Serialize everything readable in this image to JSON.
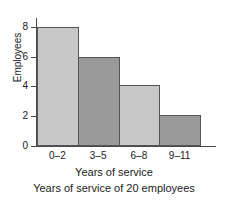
{
  "chart_data": {
    "type": "bar",
    "title": "",
    "categories": [
      "0–2",
      "3–5",
      "6–8",
      "9–11"
    ],
    "values": [
      8,
      6,
      4.1,
      2.1
    ],
    "value_labels": [
      "8",
      "6",
      "4",
      "2"
    ],
    "xlabel": "Years of service",
    "ylabel": "Employees",
    "ylim": [
      0,
      8.6
    ],
    "xlim": [
      0,
      4
    ],
    "yticks": [
      0,
      2,
      4,
      6,
      8
    ],
    "ytick_labels": [
      "0",
      "2",
      "4",
      "6",
      "8"
    ],
    "grid": false,
    "legend": false,
    "caption": "Years of service of 20 employees",
    "bar_colors": [
      "#c8c8c8",
      "#9a9a9a",
      "#c8c8c8",
      "#9a9a9a"
    ],
    "bar_edge_color": "#555555",
    "axis_color": "#4a4a4a",
    "text_color": "#1a1a1a",
    "background": "#ffffff",
    "bars_adjacent": true
  },
  "axes": {
    "y_title": "Employees",
    "x_title": "Years of service"
  },
  "caption": {
    "text": "Years of service of 20 employees"
  }
}
